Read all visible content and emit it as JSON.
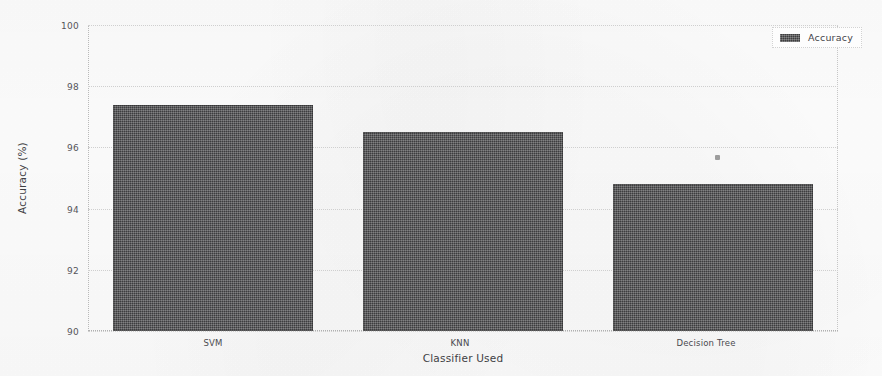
{
  "chart_data": {
    "type": "bar",
    "title": "",
    "xlabel": "Classifier Used",
    "ylabel": "Accuracy (%)",
    "categories": [
      "SVM",
      "KNN",
      "Decision Tree"
    ],
    "values": [
      97.4,
      96.5,
      94.8
    ],
    "series": [
      {
        "name": "Accuracy",
        "values": [
          97.4,
          96.5,
          94.8
        ]
      }
    ],
    "ylim": [
      90,
      100
    ],
    "yticks": [
      90,
      92,
      94,
      96,
      98,
      100
    ],
    "ytick_labels": [
      "90",
      "92",
      "94",
      "96",
      "98",
      "100"
    ],
    "grid": true,
    "grid_style": "dotted",
    "legend": {
      "position": "top-right",
      "entries": [
        {
          "label": "Accuracy",
          "color": "#4c4c4e"
        }
      ]
    },
    "bar_color": "#4c4c4e",
    "background_color": "#fdfdfd"
  },
  "artifacts": {
    "speck_name": "scan-speck"
  }
}
